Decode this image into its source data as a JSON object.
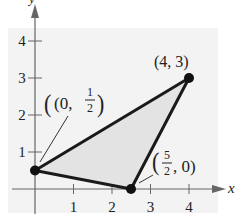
{
  "diagram": {
    "type": "coordinate-plane-triangle",
    "axes": {
      "x_label": "x",
      "y_label": "y",
      "x_ticks": [
        "1",
        "2",
        "3",
        "4"
      ],
      "y_ticks": [
        "1",
        "2",
        "3",
        "4"
      ]
    },
    "vertices": [
      {
        "x": 0,
        "y": 0.5,
        "label_main": "(0, ",
        "label_num": "1",
        "label_den": "2",
        "label_close": ")"
      },
      {
        "x": 4,
        "y": 3,
        "label": "(4, 3)"
      },
      {
        "x": 2.5,
        "y": 0,
        "label_open": "(",
        "label_num": "5",
        "label_den": "2",
        "label_rest": ", 0)"
      }
    ],
    "colors": {
      "fill": "#e6e6e6",
      "edge": "#1a1a1a",
      "axis": "#666666"
    }
  }
}
